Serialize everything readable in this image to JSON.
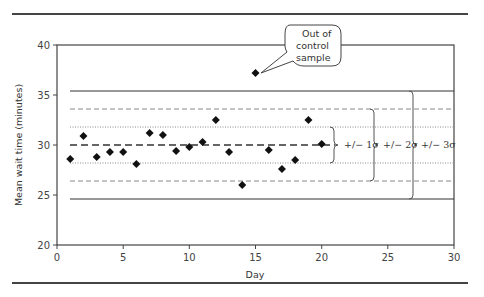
{
  "chart_data": {
    "type": "scatter",
    "title": "",
    "xlabel": "Day",
    "ylabel": "Mean  wait time (minutes)",
    "xlim": [
      0,
      30
    ],
    "ylim": [
      20,
      40
    ],
    "x_ticks": [
      0,
      5,
      10,
      15,
      20,
      25,
      30
    ],
    "y_ticks": [
      20,
      25,
      30,
      35,
      40
    ],
    "grid": false,
    "legend": null,
    "series": [
      {
        "name": "Daily mean wait time",
        "marker": "diamond",
        "x": [
          1,
          2,
          3,
          4,
          5,
          6,
          7,
          8,
          9,
          10,
          11,
          12,
          13,
          14,
          15,
          16,
          17,
          18,
          19,
          20
        ],
        "y": [
          28.6,
          30.9,
          28.8,
          29.3,
          29.3,
          28.1,
          31.2,
          31.0,
          29.4,
          29.8,
          30.3,
          32.5,
          29.3,
          26.0,
          37.2,
          29.5,
          27.6,
          28.5,
          32.5,
          30.1
        ]
      }
    ],
    "reference_lines": [
      {
        "name": "UCL (+3 sigma)",
        "y": 35.4,
        "style": "solid"
      },
      {
        "name": "+2 sigma",
        "y": 33.6,
        "style": "dashed"
      },
      {
        "name": "+1 sigma",
        "y": 31.8,
        "style": "dotted"
      },
      {
        "name": "Mean",
        "y": 30.0,
        "style": "bold-dashed"
      },
      {
        "name": "-1 sigma",
        "y": 28.2,
        "style": "dotted"
      },
      {
        "name": "-2 sigma",
        "y": 26.4,
        "style": "dashed"
      },
      {
        "name": "LCL (-3 sigma)",
        "y": 24.6,
        "style": "solid"
      }
    ],
    "annotations": [
      {
        "text": "Out of control sample",
        "points_to": {
          "x": 15,
          "y": 37.2
        }
      },
      {
        "text": "+/− 1σ",
        "bracket": [
          28.2,
          31.8
        ]
      },
      {
        "text": "+/− 2σ",
        "bracket": [
          26.4,
          33.6
        ]
      },
      {
        "text": "+/− 3σ",
        "bracket": [
          24.6,
          35.4
        ]
      }
    ]
  },
  "labels": {
    "x_axis": "Day",
    "y_axis": "Mean  wait time (minutes)",
    "callout_line1": "Out of",
    "callout_line2": "control",
    "callout_line3": "sample",
    "sigma1": "+/− 1σ",
    "sigma2": "+/− 2σ",
    "sigma3": "+/− 3σ",
    "xt0": "0",
    "xt5": "5",
    "xt10": "10",
    "xt15": "15",
    "xt20": "20",
    "xt25": "25",
    "xt30": "30",
    "yt20": "20",
    "yt25": "25",
    "yt30": "30",
    "yt35": "35",
    "yt40": "40"
  }
}
